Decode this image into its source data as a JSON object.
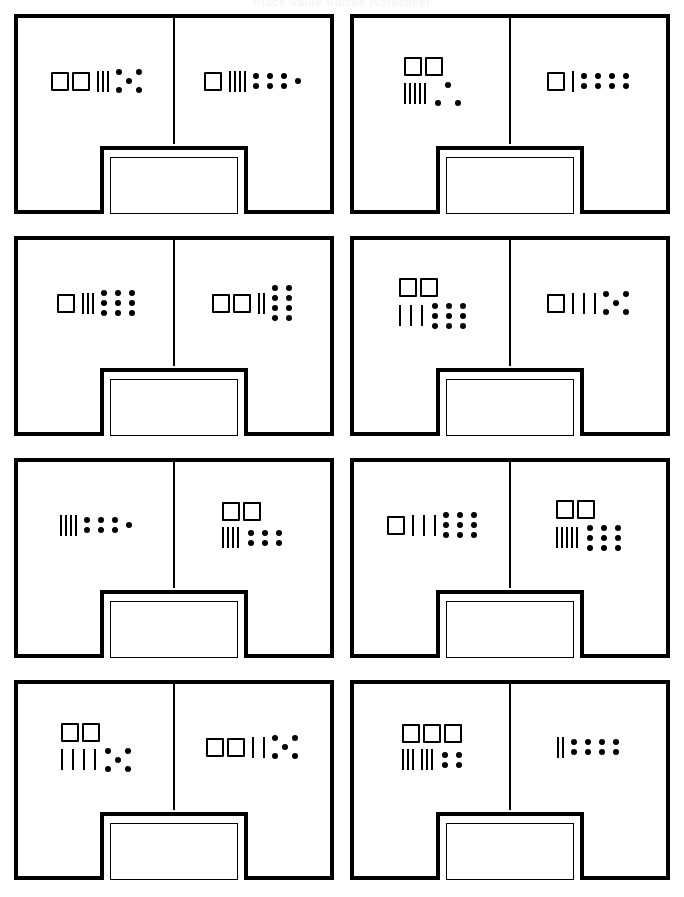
{
  "title": "Place Value Blocks Worksheet",
  "legend": {
    "hundred_name": "hundreds-square",
    "ten_name": "tens-tally",
    "one_name": "ones-dot"
  },
  "answer_box_label": "",
  "problems": [
    {
      "id": 1,
      "left": {
        "hundreds": 2,
        "tens": 3,
        "ones": 5,
        "ones_layout": "dice5",
        "tens_layout": "tight",
        "stacked": false
      },
      "right": {
        "hundreds": 1,
        "tens": 4,
        "ones": 7,
        "ones_layout": "grid3x2plus1",
        "tens_layout": "tight",
        "stacked": false
      },
      "answer": ""
    },
    {
      "id": 2,
      "left": {
        "hundreds": 2,
        "tens": 5,
        "ones": 3,
        "ones_layout": "tri3",
        "tens_layout": "tight",
        "stacked": true
      },
      "right": {
        "hundreds": 1,
        "tens": 1,
        "ones": 8,
        "ones_layout": "grid4x2",
        "tens_layout": "tight",
        "stacked": false
      },
      "answer": ""
    },
    {
      "id": 3,
      "left": {
        "hundreds": 1,
        "tens": 3,
        "ones": 9,
        "ones_layout": "grid3x3",
        "tens_layout": "tight",
        "stacked": false
      },
      "right": {
        "hundreds": 2,
        "tens": 2,
        "ones": 8,
        "ones_layout": "grid2x4",
        "tens_layout": "tight",
        "stacked": false
      },
      "answer": ""
    },
    {
      "id": 4,
      "left": {
        "hundreds": 2,
        "tens": 3,
        "ones": 9,
        "ones_layout": "grid3x3",
        "tens_layout": "wide",
        "stacked": true
      },
      "right": {
        "hundreds": 1,
        "tens": 3,
        "ones": 5,
        "ones_layout": "dice5",
        "tens_layout": "wide",
        "stacked": false
      },
      "answer": ""
    },
    {
      "id": 5,
      "left": {
        "hundreds": 0,
        "tens": 4,
        "ones": 7,
        "ones_layout": "grid3x2plus1",
        "tens_layout": "tight",
        "stacked": false
      },
      "right": {
        "hundreds": 2,
        "tens": 4,
        "ones": 6,
        "ones_layout": "grid3x2",
        "tens_layout": "tight",
        "stacked": true
      },
      "answer": ""
    },
    {
      "id": 6,
      "left": {
        "hundreds": 1,
        "tens": 3,
        "ones": 9,
        "ones_layout": "grid3x3",
        "tens_layout": "wide",
        "stacked": false
      },
      "right": {
        "hundreds": 2,
        "tens": 5,
        "ones": 9,
        "ones_layout": "grid3x3",
        "tens_layout": "tight",
        "stacked": true
      },
      "answer": ""
    },
    {
      "id": 7,
      "left": {
        "hundreds": 2,
        "tens": 4,
        "ones": 5,
        "ones_layout": "dice5",
        "tens_layout": "wide",
        "stacked": true
      },
      "right": {
        "hundreds": 2,
        "tens": 2,
        "ones": 5,
        "ones_layout": "dice5",
        "tens_layout": "wide",
        "stacked": false
      },
      "answer": ""
    },
    {
      "id": 8,
      "left": {
        "hundreds": 3,
        "tens": 6,
        "ones": 4,
        "ones_layout": "grid2x2",
        "tens_layout": "twosets",
        "stacked": true
      },
      "right": {
        "hundreds": 0,
        "tens": 2,
        "ones": 8,
        "ones_layout": "grid4x2",
        "tens_layout": "tight",
        "stacked": false
      },
      "answer": ""
    }
  ]
}
